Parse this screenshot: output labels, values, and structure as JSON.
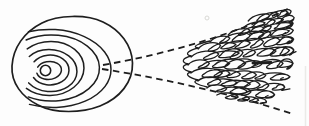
{
  "meta": {
    "figure_type": "hand-drawn line diagram",
    "background_color": "#fdfdfd",
    "ink_color": "#1e1e1e",
    "canvas": {
      "width": 309,
      "height": 126
    }
  },
  "spherulite": {
    "outline_path": "M 12 66 C 13 48 24 32 42 23 C 58 15 86 14 103 22 C 120 30 132 45 132.5 63 C 133 82 120 98 100 106 C 82 113 55 114 38 105 C 22 97 11 83 12 66 Z",
    "outline_width": 1.7,
    "core_circle": {
      "cx": 45.5,
      "cy": 70.5,
      "r": 5.2,
      "width": 1.6
    },
    "ring_width": 1.5,
    "ring_arcs": [
      "M 37.7 67.2 A 12.5 9 -6 1 1 36.9 73.3",
      "M 34.1 61.8 A 19 15 0 1 1 33.5 77.5",
      "M 29.3 56.5 A 27 21 4 1 1 28.7 82.9",
      "M 27.2 48.9 A 34 27 -3 1 1 26.4 88.4",
      "M 26.1 40 A 48 33 0 1 1 28.2 96.9",
      "M 28.5 31.8 A 60 39 2 1 1 29.5 104.4"
    ]
  },
  "magnifier": {
    "line_width": 1.8,
    "dash_pattern": "6.5 4.5",
    "upper_line_path": "M 103 65 Q 205 47 288 9",
    "lower_line_path": "M 102 69 Q 200 84 293 114"
  },
  "chains": {
    "stroke_width": 1.3,
    "rows": [
      {
        "x": 248,
        "y": 20,
        "len": 36,
        "tilt": -11,
        "h": 3.5,
        "loop": 20,
        "adv": 11
      },
      {
        "x": 243,
        "y": 27,
        "len": 44,
        "tilt": -10,
        "h": 4,
        "loop": 22,
        "adv": 12
      },
      {
        "x": 228,
        "y": 34,
        "len": 58,
        "tilt": -9,
        "h": 4.5,
        "loop": 24,
        "adv": 12
      },
      {
        "x": 210,
        "y": 41,
        "len": 76,
        "tilt": -7,
        "h": 5,
        "loop": 26,
        "adv": 13
      },
      {
        "x": 198,
        "y": 48,
        "len": 88,
        "tilt": -5,
        "h": 5,
        "loop": 27,
        "adv": 13
      },
      {
        "x": 191,
        "y": 56,
        "len": 95,
        "tilt": -3,
        "h": 5.5,
        "loop": 26,
        "adv": 13
      },
      {
        "x": 188,
        "y": 64,
        "len": 97,
        "tilt": 0,
        "h": 5.5,
        "loop": 27,
        "adv": 13
      },
      {
        "x": 191,
        "y": 72,
        "len": 91,
        "tilt": 3,
        "h": 5,
        "loop": 26,
        "adv": 13
      },
      {
        "x": 198,
        "y": 80,
        "len": 79,
        "tilt": 5,
        "h": 5,
        "loop": 25,
        "adv": 13
      },
      {
        "x": 207,
        "y": 87,
        "len": 60,
        "tilt": 7,
        "h": 4.5,
        "loop": 24,
        "adv": 12
      },
      {
        "x": 217,
        "y": 94,
        "len": 42,
        "tilt": 9,
        "h": 4,
        "loop": 22,
        "adv": 12
      }
    ],
    "connector_pairs": [
      [
        3,
        4
      ],
      [
        4,
        5
      ],
      [
        5,
        6
      ],
      [
        6,
        7
      ],
      [
        7,
        8
      ],
      [
        8,
        9
      ]
    ],
    "dense_segment": {
      "x1": 253,
      "y1": 63,
      "x2": 271,
      "y2": 62.5,
      "width": 3
    }
  },
  "artifacts": {
    "edge_line": {
      "x": 305.5,
      "y1": 66,
      "y2": 126,
      "color": "#ebebe8",
      "width": 1.5
    },
    "smudge": {
      "cx": 207,
      "cy": 18,
      "r": 2,
      "color": "#d9d9d5"
    }
  }
}
